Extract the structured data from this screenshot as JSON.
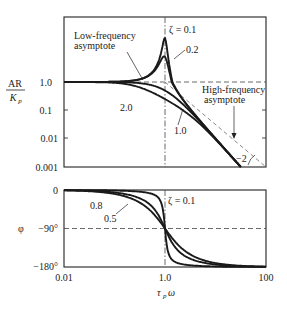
{
  "chart_data": [
    {
      "type": "line",
      "title": "Amplitude ratio of second-order system",
      "xlabel": "τ_p ω",
      "ylabel_num": "AR",
      "ylabel_den": "K_p",
      "xscale": "log",
      "yscale": "log",
      "xlim": [
        0.01,
        100
      ],
      "ylim": [
        0.001,
        10
      ],
      "yticks": [
        {
          "value": 1.0,
          "label": "1.0"
        },
        {
          "value": 0.1,
          "label": "0.1"
        },
        {
          "value": 0.01,
          "label": "0.01"
        },
        {
          "value": 0.001,
          "label": "0.001"
        }
      ],
      "series": [
        {
          "name": "ζ = 0.1",
          "zeta": 0.1,
          "peak_AR": 5.0
        },
        {
          "name": "0.2",
          "zeta": 0.2,
          "peak_AR": 2.5
        },
        {
          "name": "1.0",
          "zeta": 1.0
        },
        {
          "name": "2.0",
          "zeta": 2.0
        }
      ],
      "asymptotes": [
        {
          "name": "Low-frequency asymptote",
          "AR": 1.0
        },
        {
          "name": "High-frequency asymptote",
          "slope": -2
        }
      ],
      "annotations": {
        "zeta_label": "ζ = 0.1",
        "zeta_02": "0.2",
        "zeta_10": "1.0",
        "zeta_20": "2.0",
        "low_freq_1": "Low-frequency",
        "low_freq_2": "asymptote",
        "high_freq_1": "High-frequency",
        "high_freq_2": "asymptote",
        "slope": "−2"
      },
      "grid": false,
      "reference_lines": [
        "AR = 1.0 (dashed)",
        "τ_p ω = 1.0 (dash-dot)"
      ]
    },
    {
      "type": "line",
      "title": "Phase angle of second-order system",
      "xlabel": "τ_p ω",
      "ylabel": "φ",
      "xscale": "log",
      "xlim": [
        0.01,
        100
      ],
      "ylim": [
        -180,
        0
      ],
      "xticks": [
        {
          "value": 0.01,
          "label": "0.01"
        },
        {
          "value": 1.0,
          "label": "1.0"
        },
        {
          "value": 100,
          "label": "100"
        }
      ],
      "yticks": [
        {
          "value": 0,
          "label": "0"
        },
        {
          "value": -90,
          "label": "−90°"
        },
        {
          "value": -180,
          "label": "−180°"
        }
      ],
      "series": [
        {
          "name": "ζ = 0.1",
          "zeta": 0.1
        },
        {
          "name": "0.5",
          "zeta": 0.5
        },
        {
          "name": "0.8",
          "zeta": 0.8
        }
      ],
      "annotations": {
        "zeta_label": "ζ = 0.1",
        "zeta_05": "0.5",
        "zeta_08": "0.8"
      },
      "grid": false,
      "reference_lines": [
        "φ = −90° (dashed)",
        "τ_p ω = 1.0 (dash-dot)"
      ]
    }
  ],
  "labels": {
    "ar_num": "AR",
    "ar_den": "K",
    "ar_den_sub": "p",
    "phi": "φ",
    "xlabel_tau": "τ",
    "xlabel_sub": "p",
    "xlabel_omega": "ω"
  }
}
